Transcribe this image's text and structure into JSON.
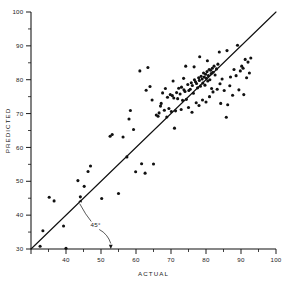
{
  "chart_data": {
    "type": "scatter",
    "title": "",
    "xlabel": "ACTUAL",
    "ylabel": "PREDICTED",
    "xlim": [
      30,
      100
    ],
    "ylim": [
      30,
      100
    ],
    "grid": false,
    "legend": null,
    "x_major_ticks": [
      30,
      40,
      50,
      60,
      70,
      80,
      90,
      100
    ],
    "x_major_tick_labels": [
      "",
      "40",
      "50",
      "60",
      "70",
      "80",
      "90",
      "100"
    ],
    "y_major_ticks": [
      30,
      40,
      50,
      60,
      70,
      80,
      90,
      100
    ],
    "y_major_tick_labels": [
      "30",
      "40",
      "50",
      "60",
      "70",
      "80",
      "90",
      "100"
    ],
    "x_minor_ticks": [
      35,
      45,
      55,
      65,
      75,
      85,
      95
    ],
    "y_minor_ticks": [
      35,
      45,
      55,
      65,
      75,
      85,
      95
    ],
    "reference_line": {
      "label": "45°",
      "from": [
        30,
        30
      ],
      "to": [
        100,
        100
      ],
      "slope": 1,
      "intercept": 0
    },
    "annotations": [
      {
        "text": "45°",
        "x": 48.5,
        "y": 36.5,
        "points_to": [
          [
            43.5,
            44.0
          ],
          [
            52.8,
            30.0
          ]
        ]
      }
    ],
    "marker": {
      "shape": "circle",
      "size": 1.55,
      "color": "#111111"
    },
    "points": [
      [
        32.6,
        30.8
      ],
      [
        33.4,
        35.4
      ],
      [
        35.2,
        45.3
      ],
      [
        36.6,
        44.2
      ],
      [
        39.3,
        36.8
      ],
      [
        40.0,
        30.2
      ],
      [
        43.4,
        50.2
      ],
      [
        44.1,
        45.4
      ],
      [
        45.2,
        48.5
      ],
      [
        46.3,
        52.9
      ],
      [
        47.0,
        54.5
      ],
      [
        50.2,
        44.9
      ],
      [
        52.6,
        63.3
      ],
      [
        53.2,
        63.8
      ],
      [
        55.0,
        46.4
      ],
      [
        56.3,
        63.1
      ],
      [
        57.4,
        57.2
      ],
      [
        58.0,
        68.4
      ],
      [
        58.4,
        70.9
      ],
      [
        59.3,
        65.3
      ],
      [
        59.9,
        52.8
      ],
      [
        61.1,
        82.6
      ],
      [
        61.6,
        55.2
      ],
      [
        62.6,
        52.4
      ],
      [
        62.9,
        76.9
      ],
      [
        63.4,
        83.6
      ],
      [
        64.0,
        78.0
      ],
      [
        65.0,
        55.1
      ],
      [
        65.8,
        69.6
      ],
      [
        66.3,
        69.2
      ],
      [
        66.6,
        70.2
      ],
      [
        67.2,
        73.0
      ],
      [
        67.6,
        76.1
      ],
      [
        68.1,
        71.0
      ],
      [
        68.4,
        77.4
      ],
      [
        69.0,
        74.8
      ],
      [
        69.4,
        71.5
      ],
      [
        69.8,
        75.6
      ],
      [
        70.1,
        70.6
      ],
      [
        70.4,
        75.3
      ],
      [
        70.8,
        74.6
      ],
      [
        71.0,
        65.7
      ],
      [
        71.3,
        70.8
      ],
      [
        71.6,
        76.2
      ],
      [
        71.9,
        74.4
      ],
      [
        72.2,
        77.5
      ],
      [
        72.6,
        75.8
      ],
      [
        73.0,
        77.8
      ],
      [
        73.3,
        73.9
      ],
      [
        73.7,
        77.0
      ],
      [
        74.0,
        76.5
      ],
      [
        74.4,
        74.2
      ],
      [
        74.8,
        78.6
      ],
      [
        75.1,
        76.8
      ],
      [
        75.5,
        77.2
      ],
      [
        75.8,
        79.1
      ],
      [
        76.1,
        78.3
      ],
      [
        76.4,
        76.0
      ],
      [
        76.7,
        80.0
      ],
      [
        77.0,
        79.4
      ],
      [
        77.3,
        78.9
      ],
      [
        77.6,
        77.6
      ],
      [
        77.9,
        80.6
      ],
      [
        78.1,
        79.8
      ],
      [
        78.4,
        78.1
      ],
      [
        78.6,
        81.0
      ],
      [
        78.9,
        80.2
      ],
      [
        79.1,
        79.0
      ],
      [
        79.3,
        82.0
      ],
      [
        79.5,
        80.8
      ],
      [
        79.7,
        78.4
      ],
      [
        79.9,
        81.6
      ],
      [
        80.1,
        80.4
      ],
      [
        80.3,
        82.4
      ],
      [
        80.5,
        79.6
      ],
      [
        80.7,
        81.2
      ],
      [
        80.9,
        83.0
      ],
      [
        81.1,
        80.0
      ],
      [
        81.3,
        82.8
      ],
      [
        81.5,
        81.8
      ],
      [
        81.8,
        83.4
      ],
      [
        82.0,
        82.2
      ],
      [
        82.3,
        84.0
      ],
      [
        82.6,
        81.4
      ],
      [
        83.0,
        83.2
      ],
      [
        83.4,
        84.6
      ],
      [
        67.0,
        72.2
      ],
      [
        72.9,
        71.2
      ],
      [
        76.0,
        70.4
      ],
      [
        77.2,
        73.2
      ],
      [
        78.0,
        72.4
      ],
      [
        79.0,
        74.0
      ],
      [
        80.0,
        73.4
      ],
      [
        81.0,
        75.0
      ],
      [
        82.0,
        76.4
      ],
      [
        83.2,
        77.2
      ],
      [
        84.0,
        78.8
      ],
      [
        84.6,
        80.2
      ],
      [
        85.2,
        76.8
      ],
      [
        85.8,
        68.9
      ],
      [
        86.2,
        72.6
      ],
      [
        78.2,
        86.8
      ],
      [
        80.4,
        85.6
      ],
      [
        83.8,
        88.2
      ],
      [
        86.0,
        88.6
      ],
      [
        87.0,
        80.8
      ],
      [
        87.6,
        75.4
      ],
      [
        88.0,
        83.0
      ],
      [
        88.6,
        81.2
      ],
      [
        89.0,
        90.2
      ],
      [
        89.4,
        77.0
      ],
      [
        89.8,
        82.6
      ],
      [
        90.2,
        84.0
      ],
      [
        90.6,
        83.4
      ],
      [
        90.8,
        75.6
      ],
      [
        91.2,
        86.0
      ],
      [
        91.6,
        80.6
      ],
      [
        92.0,
        85.2
      ],
      [
        92.4,
        82.0
      ],
      [
        92.8,
        86.4
      ],
      [
        84.2,
        73.0
      ],
      [
        86.8,
        78.2
      ],
      [
        74.2,
        84.0
      ],
      [
        75.0,
        71.8
      ],
      [
        70.6,
        79.6
      ],
      [
        64.6,
        74.0
      ],
      [
        68.8,
        69.0
      ],
      [
        73.6,
        80.4
      ],
      [
        76.6,
        83.8
      ],
      [
        81.6,
        77.4
      ]
    ]
  }
}
